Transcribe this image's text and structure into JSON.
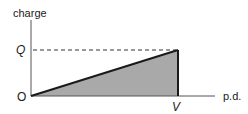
{
  "diagram": {
    "y_axis_label": "charge",
    "x_axis_label": "p.d.",
    "origin_label": "O",
    "y_marker_label": "Q",
    "x_marker_label": "V",
    "shaded_region": "triangle under charge vs p.d. line (energy stored)",
    "colors": {
      "line": "#1a1a1a",
      "fill": "#a9a9a9",
      "dashed": "#333333"
    }
  }
}
